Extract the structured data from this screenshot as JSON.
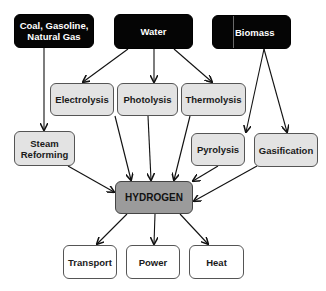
{
  "diagram": {
    "colors": {
      "source_fill": "#050505",
      "process_fill": "#e3e3e3",
      "hub_fill": "#9b9b9b",
      "output_fill": "#ffffff",
      "arrow": "#111111"
    },
    "sources": {
      "fossil": "Coal, Gasoline, Natural Gas",
      "water": "Water",
      "biomass": "Biomass"
    },
    "processes": {
      "steam_reforming": "Steam Reforming",
      "electrolysis": "Electrolysis",
      "photolysis": "Photolysis",
      "thermolysis": "Thermolysis",
      "pyrolysis": "Pyrolysis",
      "gasification": "Gasification"
    },
    "hub": {
      "label": "HYDROGEN"
    },
    "outputs": {
      "transport": "Transport",
      "power": "Power",
      "heat": "Heat"
    },
    "edges": [
      {
        "from": "Coal, Gasoline, Natural Gas",
        "to": "Steam Reforming"
      },
      {
        "from": "Water",
        "to": "Electrolysis"
      },
      {
        "from": "Water",
        "to": "Photolysis"
      },
      {
        "from": "Water",
        "to": "Thermolysis"
      },
      {
        "from": "Biomass",
        "to": "Pyrolysis"
      },
      {
        "from": "Biomass",
        "to": "Gasification"
      },
      {
        "from": "Steam Reforming",
        "to": "HYDROGEN"
      },
      {
        "from": "Electrolysis",
        "to": "HYDROGEN"
      },
      {
        "from": "Photolysis",
        "to": "HYDROGEN"
      },
      {
        "from": "Thermolysis",
        "to": "HYDROGEN"
      },
      {
        "from": "Pyrolysis",
        "to": "HYDROGEN"
      },
      {
        "from": "Gasification",
        "to": "HYDROGEN"
      },
      {
        "from": "HYDROGEN",
        "to": "Transport"
      },
      {
        "from": "HYDROGEN",
        "to": "Power"
      },
      {
        "from": "HYDROGEN",
        "to": "Heat"
      }
    ]
  }
}
